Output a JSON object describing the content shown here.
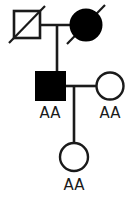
{
  "diagram": {
    "type": "pedigree-chart",
    "width": 136,
    "height": 200,
    "background_color": "#ffffff",
    "line_color": "#1a1a1a",
    "fill_affected_color": "#000000",
    "fill_unaffected_color": "#ffffff"
  },
  "generations": [
    {
      "id": "generation-I",
      "individuals": [
        {
          "id": "I-1",
          "sex": "male",
          "shape": "square",
          "affected": false,
          "deceased": true,
          "genotype_label": ""
        },
        {
          "id": "I-2",
          "sex": "female",
          "shape": "circle",
          "affected": true,
          "deceased": true,
          "genotype_label": ""
        }
      ]
    },
    {
      "id": "generation-II",
      "individuals": [
        {
          "id": "II-1",
          "sex": "male",
          "shape": "square",
          "affected": true,
          "deceased": false,
          "genotype_label": "AA"
        },
        {
          "id": "II-2",
          "sex": "female",
          "shape": "circle",
          "affected": false,
          "deceased": false,
          "genotype_label": "AA"
        }
      ]
    },
    {
      "id": "generation-III",
      "individuals": [
        {
          "id": "III-1",
          "sex": "female",
          "shape": "circle",
          "affected": false,
          "deceased": false,
          "genotype_label": "AA"
        }
      ]
    }
  ],
  "labels": {
    "affected_male_genotype": "AA",
    "unaffected_female_genotype": "AA",
    "child_genotype": "AA"
  }
}
